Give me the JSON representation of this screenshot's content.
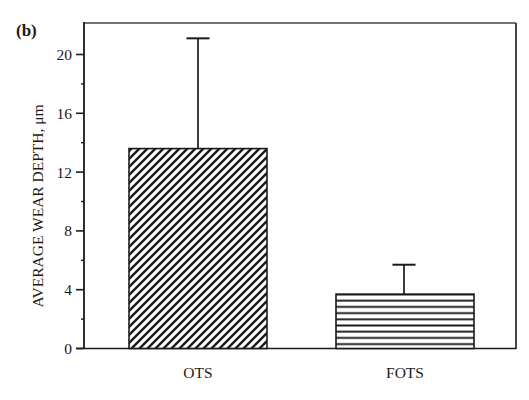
{
  "panel_label": "(b)",
  "chart_data": {
    "type": "bar",
    "title": "",
    "panel": "(b)",
    "xlabel": "",
    "ylabel": "AVERAGE WEAR DEPTH, μm",
    "categories": [
      "OTS",
      "FOTS"
    ],
    "values": [
      13.6,
      3.7
    ],
    "error_upper": [
      21.1,
      5.7
    ],
    "error_plus": [
      7.5,
      2.0
    ],
    "ylim": [
      0,
      22
    ],
    "yticks": [
      0,
      4,
      8,
      12,
      16,
      20
    ],
    "yticks_minor": [
      2,
      6,
      10,
      14,
      18
    ],
    "grid": false,
    "legend": null,
    "fill_patterns": [
      "diagonal-hatch",
      "horizontal-lines"
    ],
    "colors": {
      "ink": "#1a1a1a",
      "background": "#ffffff"
    }
  }
}
